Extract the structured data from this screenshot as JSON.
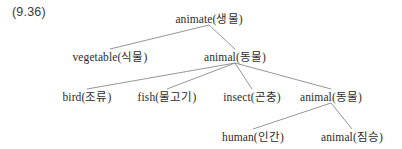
{
  "example": {
    "number_label": "(9.36)"
  },
  "diagram": {
    "type": "semantic-feature-tree",
    "line_color": "#8a8a8a",
    "text_color": "#2b2b2b",
    "background": "#ffffff",
    "nodes": [
      {
        "id": "animate",
        "label": "animate(생물)",
        "english": "animate",
        "korean": "생물",
        "level": 0,
        "x": 209,
        "y": 18
      },
      {
        "id": "vegetable",
        "label": "vegetable(식물)",
        "english": "vegetable",
        "korean": "식물",
        "level": 1,
        "x": 110,
        "y": 56
      },
      {
        "id": "animal-l1",
        "label": "animal(동물)",
        "english": "animal",
        "korean": "동물",
        "level": 1,
        "x": 235,
        "y": 56
      },
      {
        "id": "bird",
        "label": "bird(조류)",
        "english": "bird",
        "korean": "조류",
        "level": 2,
        "x": 87,
        "y": 96
      },
      {
        "id": "fish",
        "label": "fish(물고기)",
        "english": "fish",
        "korean": "물고기",
        "level": 2,
        "x": 167,
        "y": 96
      },
      {
        "id": "insect",
        "label": "insect(곤충)",
        "english": "insect",
        "korean": "곤충",
        "level": 2,
        "x": 252,
        "y": 96
      },
      {
        "id": "animal-l2",
        "label": "animal(동물)",
        "english": "animal",
        "korean": "동물",
        "level": 2,
        "x": 331,
        "y": 96
      },
      {
        "id": "human",
        "label": "human(인간)",
        "english": "human",
        "korean": "인간",
        "level": 3,
        "x": 253,
        "y": 136
      },
      {
        "id": "animal-l3",
        "label": "animal(짐승)",
        "english": "animal",
        "korean": "짐승",
        "level": 3,
        "x": 352,
        "y": 136
      }
    ],
    "edges": [
      {
        "from": "animate",
        "to": "vegetable"
      },
      {
        "from": "animate",
        "to": "animal-l1"
      },
      {
        "from": "animal-l1",
        "to": "bird"
      },
      {
        "from": "animal-l1",
        "to": "fish"
      },
      {
        "from": "animal-l1",
        "to": "insect"
      },
      {
        "from": "animal-l1",
        "to": "animal-l2"
      },
      {
        "from": "animal-l2",
        "to": "human"
      },
      {
        "from": "animal-l2",
        "to": "animal-l3"
      }
    ]
  }
}
